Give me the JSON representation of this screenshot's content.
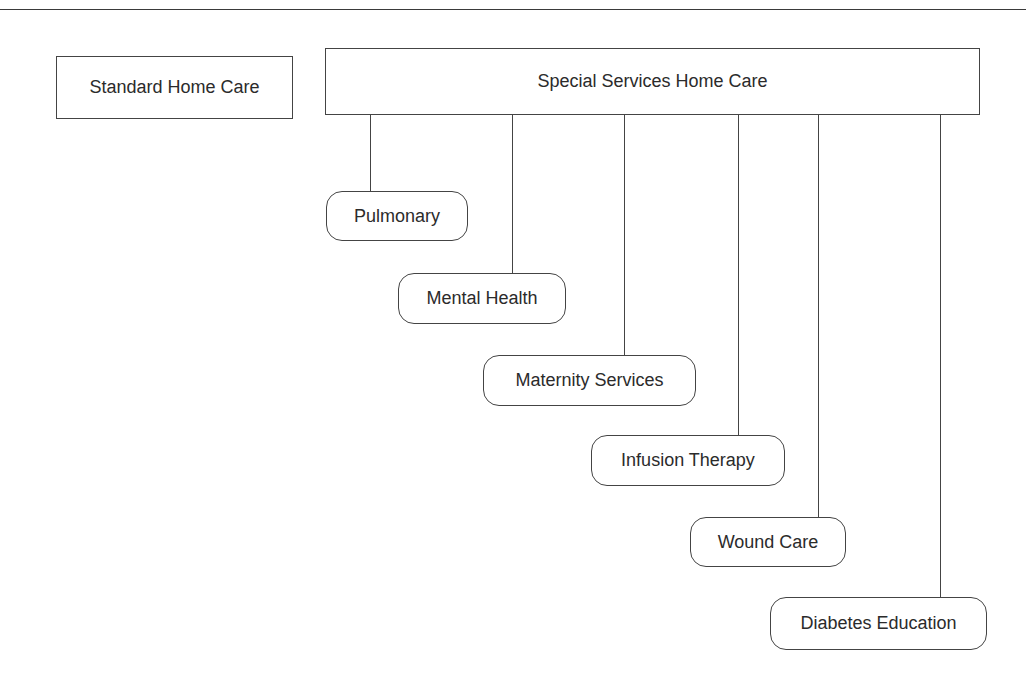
{
  "diagram": {
    "type": "hierarchy",
    "standalone": {
      "label": "Standard Home Care"
    },
    "parent": {
      "label": "Special Services Home Care"
    },
    "children": [
      {
        "label": "Pulmonary"
      },
      {
        "label": "Mental Health"
      },
      {
        "label": "Maternity Services"
      },
      {
        "label": "Infusion Therapy"
      },
      {
        "label": "Wound Care"
      },
      {
        "label": "Diabetes Education"
      }
    ],
    "colors": {
      "stroke": "#444444",
      "text": "#2b2b2b",
      "background": "#ffffff"
    }
  }
}
